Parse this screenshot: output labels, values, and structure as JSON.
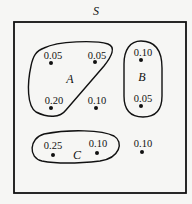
{
  "diagram": {
    "universe_label": "S",
    "sets": [
      {
        "name": "A",
        "label": "A"
      },
      {
        "name": "B",
        "label": "B"
      },
      {
        "name": "C",
        "label": "C"
      }
    ],
    "points": [
      {
        "value": "0.05",
        "set": "A"
      },
      {
        "value": "0.05",
        "set": "A"
      },
      {
        "value": "0.20",
        "set": "A"
      },
      {
        "value": "0.10",
        "set": "none"
      },
      {
        "value": "0.10",
        "set": "B"
      },
      {
        "value": "0.05",
        "set": "B"
      },
      {
        "value": "0.25",
        "set": "C"
      },
      {
        "value": "0.10",
        "set": "C"
      },
      {
        "value": "0.10",
        "set": "none"
      }
    ]
  }
}
